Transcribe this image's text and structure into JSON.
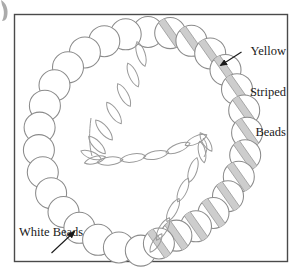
{
  "figure": {
    "frame": {
      "border_color": "#4a4a4a",
      "background": "#ffffff",
      "x": 14,
      "y": 14,
      "width": 274,
      "height": 248
    },
    "page_background": "#ffffff",
    "corner_artifact": {
      "name": "page-edge-smudge",
      "color": "#8a8a8a",
      "x": 0,
      "y": 0,
      "width": 14,
      "height": 22
    }
  },
  "annotations": [
    {
      "id": "yellow-striped-beads",
      "lines": [
        "Yellow",
        "Striped",
        "Beads"
      ],
      "text": "Yellow Striped Beads",
      "align": "right",
      "arrow": {
        "from": [
          240,
          53
        ],
        "to": [
          218,
          66
        ]
      }
    },
    {
      "id": "white-beads",
      "lines": [
        "White Beads"
      ],
      "text": "White Beads",
      "align": "left",
      "arrow": {
        "from": [
          52,
          253
        ],
        "to": [
          76,
          232
        ]
      }
    }
  ],
  "necklace": {
    "outer_ring": {
      "description": "Ring of round beads forming the necklace loop",
      "center": [
        148,
        139
      ],
      "radius": 107,
      "bead_radius": 15.5,
      "bead_count": 30,
      "white_bead_count": 16,
      "striped_bead_count": 14,
      "stroke_color": "#8b8b8b",
      "white_bead_fill": "#ffffff",
      "striped_bead_fill": "#ffffff",
      "stripe_color": "#c9c9c9",
      "stripe_edge_color": "#9a9a9a",
      "stripe_angle_deg": 55
    },
    "inner_strand": {
      "description": "Inner S-shaped strand of elongated lens-shaped beads",
      "bead_shape": "lens",
      "bead_count": 22,
      "stroke_color": "#9a9a9a"
    }
  },
  "colors": {
    "ink": "#1a1a1a",
    "bead_outline": "#8b8b8b",
    "stripe_gray": "#c9c9c9",
    "frame": "#4a4a4a"
  }
}
